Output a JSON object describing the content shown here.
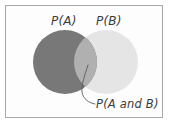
{
  "figure": {
    "background_color": "#ffffff",
    "border_color": "#a8a8a8"
  },
  "labels": {
    "set_a": "P(A)",
    "set_b": "P(B)",
    "intersection": "P(A and B)"
  },
  "colors": {
    "circle_a_fill": "#787878",
    "circle_b_fill": "#e5e5e5",
    "intersection_fill": "#b0b0b0",
    "leader_line": "#5a5a5a",
    "text": "#3a3a3a"
  },
  "chart_data": {
    "type": "venn",
    "title": "",
    "sets": [
      {
        "name": "A",
        "label": "P(A)",
        "cx": 65,
        "cy": 62,
        "r": 32,
        "fill": "#787878"
      },
      {
        "name": "B",
        "label": "P(B)",
        "cx": 106,
        "cy": 62,
        "r": 32,
        "fill": "#e5e5e5"
      }
    ],
    "intersection": {
      "label": "P(A and B)",
      "fill": "#b0b0b0",
      "leader_line": {
        "start": [
          88,
          65
        ],
        "mid": [
          82,
          92
        ],
        "end": [
          95,
          104
        ]
      }
    },
    "legend": "none",
    "grid": false
  }
}
